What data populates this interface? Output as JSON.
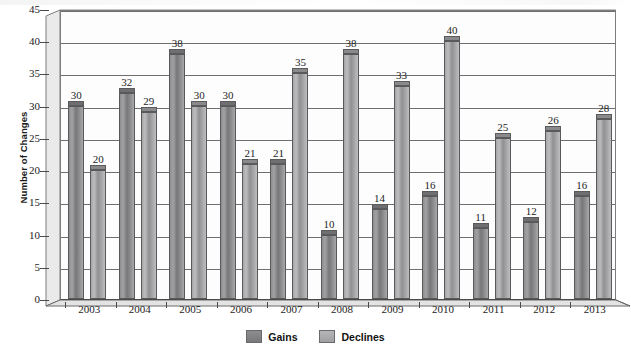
{
  "chart_data": {
    "type": "bar",
    "title": "",
    "subtitle": "",
    "xlabel": "",
    "ylabel": "Number of Changes",
    "categories": [
      "2003",
      "2004",
      "2005",
      "2006",
      "2007",
      "2008",
      "2009",
      "2010",
      "2011",
      "2012",
      "2013"
    ],
    "series": [
      {
        "name": "Gains",
        "color": "#8b8b8e",
        "values": [
          30,
          32,
          38,
          30,
          21,
          10,
          14,
          16,
          11,
          12,
          16
        ]
      },
      {
        "name": "Declines",
        "color": "#b2b2b5",
        "values": [
          20,
          29,
          30,
          21,
          35,
          38,
          33,
          40,
          25,
          26,
          28
        ]
      }
    ],
    "ylim": [
      0,
      45
    ],
    "ytick_step": 5,
    "yticks": [
      "0",
      "5",
      "10",
      "15",
      "20",
      "25",
      "30",
      "35",
      "40",
      "45"
    ],
    "grid": true,
    "legend_position": "bottom-center",
    "style": "3d-clustered-column",
    "data_labels": true
  },
  "legend": {
    "items": [
      {
        "label": "Gains"
      },
      {
        "label": "Declines"
      }
    ]
  },
  "axes": {
    "y_axis_title": "Number of Changes"
  }
}
